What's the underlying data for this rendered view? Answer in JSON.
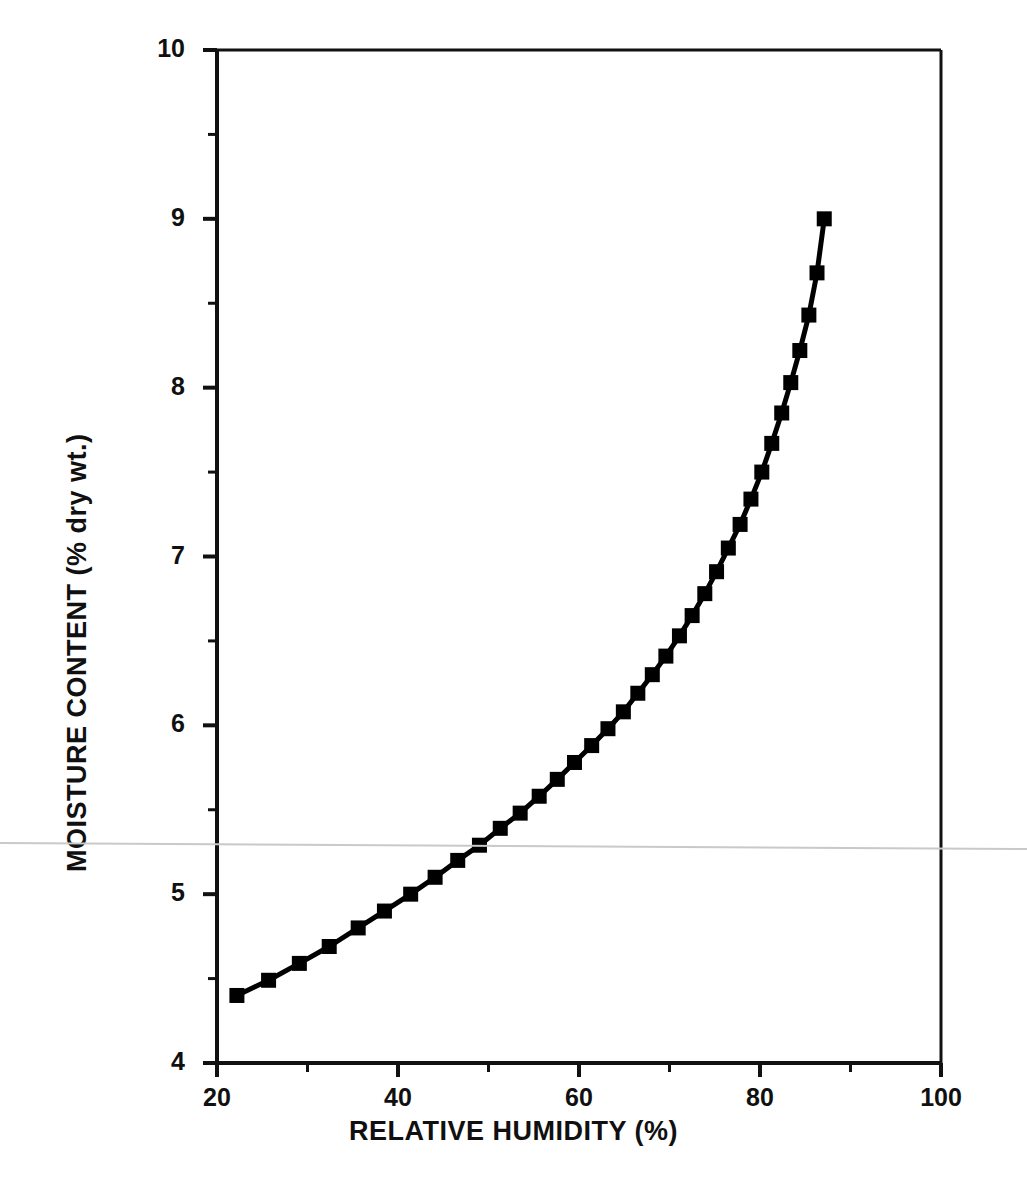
{
  "chart_data": {
    "type": "line",
    "title": "",
    "xlabel": "RELATIVE HUMIDITY (%)",
    "ylabel": "MOISTURE CONTENT (% dry wt.)",
    "xlim": [
      20,
      100
    ],
    "ylim": [
      4,
      10
    ],
    "grid": false,
    "legend": null,
    "marker": "filled-square",
    "line_color": "#000000",
    "marker_color": "#000000",
    "x_major_ticks": [
      20,
      40,
      60,
      80,
      100
    ],
    "x_minor_ticks": [
      30,
      50,
      70,
      90
    ],
    "x_tick_labels": [
      "20",
      "40",
      "60",
      "80",
      "100"
    ],
    "y_major_ticks": [
      4,
      5,
      6,
      7,
      8,
      9,
      10
    ],
    "y_minor_ticks": [
      4.5,
      5.5,
      6.5,
      7.5,
      8.5,
      9.5
    ],
    "y_tick_labels": [
      "4",
      "5",
      "6",
      "7",
      "8",
      "9",
      "10"
    ],
    "series": [
      {
        "name": "sorption-isotherm",
        "x": [
          22.2,
          25.7,
          29.1,
          32.4,
          35.6,
          38.5,
          41.4,
          44.1,
          46.6,
          49.0,
          51.3,
          53.5,
          55.6,
          57.6,
          59.5,
          61.4,
          63.2,
          64.9,
          66.5,
          68.1,
          69.6,
          71.1,
          72.5,
          73.9,
          75.2,
          76.5,
          77.8,
          79.0,
          80.2,
          81.3,
          82.4,
          83.4,
          84.4,
          85.4,
          86.3,
          87.1
        ],
        "y": [
          4.4,
          4.49,
          4.59,
          4.69,
          4.8,
          4.9,
          5.0,
          5.1,
          5.2,
          5.29,
          5.39,
          5.48,
          5.58,
          5.68,
          5.78,
          5.88,
          5.98,
          6.08,
          6.19,
          6.3,
          6.41,
          6.53,
          6.65,
          6.78,
          6.91,
          7.05,
          7.19,
          7.34,
          7.5,
          7.67,
          7.85,
          8.03,
          8.22,
          8.43,
          8.68,
          9.0
        ]
      }
    ]
  },
  "artifact": {
    "name": "scan-line",
    "color": "#c9c9c9"
  }
}
